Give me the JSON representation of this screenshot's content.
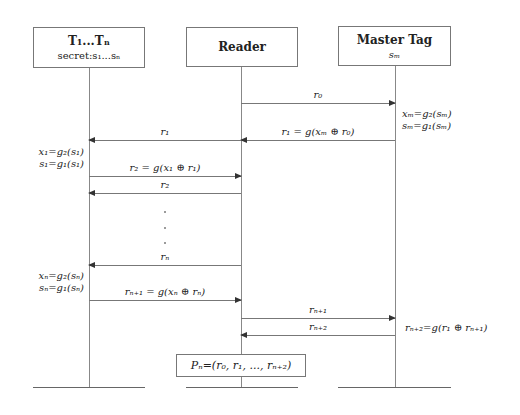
{
  "participants": [
    {
      "id": "tags",
      "title": "T₁...Tₙ",
      "subtitle": "secret:s₁...sₙ"
    },
    {
      "id": "reader",
      "title": "Reader",
      "subtitle": ""
    },
    {
      "id": "master",
      "title": "Master Tag",
      "subtitle": "sₘ"
    }
  ],
  "messages": [
    {
      "from": "reader",
      "to": "master",
      "label": "r₀"
    },
    {
      "from": "master",
      "to": "reader",
      "label": "r₁ = g(xₘ ⊕ r₀)"
    },
    {
      "from": "reader",
      "to": "tags",
      "label": "r₁"
    },
    {
      "from": "tags",
      "to": "reader",
      "label": "r₂ = g(x₁ ⊕ r₁)"
    },
    {
      "from": "reader",
      "to": "tags",
      "label": "r₂"
    },
    {
      "from": "reader",
      "to": "tags",
      "label": "rₙ"
    },
    {
      "from": "tags",
      "to": "reader",
      "label": "rₙ₊₁ = g(xₙ ⊕ rₙ)"
    },
    {
      "from": "reader",
      "to": "master",
      "label": "rₙ₊₁"
    },
    {
      "from": "master",
      "to": "reader",
      "label": "rₙ₊₂"
    }
  ],
  "notes": {
    "master_1": [
      "xₘ=g₂(sₘ)",
      "sₘ=g₁(sₘ)"
    ],
    "tags_1": [
      "x₁=g₂(s₁)",
      "s₁=g₁(s₁)"
    ],
    "tags_n": [
      "xₙ=g₂(sₙ)",
      "sₙ=g₁(sₙ)"
    ],
    "master_2": "rₙ₊₂=g(r₁ ⊕ rₙ₊₁)"
  },
  "result": "Pₙ=(r₀, r₁, ..., rₙ₊₂)"
}
